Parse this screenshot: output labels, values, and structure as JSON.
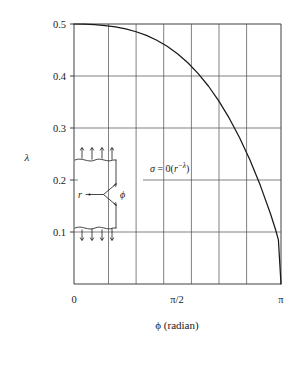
{
  "chart_data": {
    "type": "line",
    "title": "",
    "subtitle": "",
    "xlabel": "ϕ (radian)",
    "ylabel": "λ",
    "xlim": [
      0,
      3.14159265
    ],
    "ylim": [
      0,
      0.5
    ],
    "grid": true,
    "legend": null,
    "x_tick_labels": [
      "0",
      "π/2",
      "π"
    ],
    "x_tick_values": [
      0,
      1.5707963,
      3.1415927
    ],
    "y_tick_labels": [
      "0.1",
      "0.2",
      "0.3",
      "0.4",
      "0.5"
    ],
    "y_tick_values": [
      0.1,
      0.2,
      0.3,
      0.4,
      0.5
    ],
    "x_gridline_values": [
      0.5235988,
      0.9424778,
      1.3613568,
      1.7802358,
      2.1991149,
      2.6179939
    ],
    "y_gridline_values": [
      0.1,
      0.2,
      0.3,
      0.4,
      0.5
    ],
    "series": [
      {
        "name": "λ(ϕ)",
        "x": [
          0.0,
          0.15708,
          0.31416,
          0.47124,
          0.62832,
          0.7854,
          0.94248,
          1.09956,
          1.25664,
          1.41372,
          1.5708,
          1.72788,
          1.88496,
          2.04204,
          2.19911,
          2.35619,
          2.51327,
          2.67035,
          2.82743,
          2.98451,
          3.06305,
          3.10232,
          3.14159
        ],
        "y": [
          0.5,
          0.4997,
          0.4988,
          0.4971,
          0.4944,
          0.4905,
          0.4851,
          0.478,
          0.4688,
          0.4572,
          0.4429,
          0.4255,
          0.4047,
          0.3803,
          0.3518,
          0.3189,
          0.2813,
          0.2384,
          0.1897,
          0.1341,
          0.1028,
          0.0848,
          0.0
        ]
      }
    ],
    "annotations": [
      {
        "name": "stress-singularity-order",
        "text": "σ = 0(r−λ)",
        "text_plain": "σ = 0(r^-λ)",
        "sigma": "σ",
        "equals": "=",
        "zero": "0(",
        "r": "r",
        "exponent": "−λ",
        "close": ")"
      }
    ],
    "inset": {
      "name": "v-notch-specimen",
      "radius_label": "r",
      "angle_label": "ϕ",
      "top_arrow_count": 4,
      "bottom_arrow_count": 4,
      "description": "V-notched plate under remote tension"
    }
  }
}
